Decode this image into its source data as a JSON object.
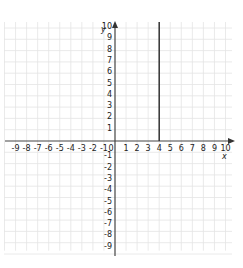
{
  "chart_data": {
    "type": "line",
    "title": "",
    "xlabel": "x",
    "ylabel": "y",
    "xlim": [
      -9,
      10
    ],
    "ylim": [
      -9,
      10
    ],
    "grid": true,
    "x_ticks": [
      -9,
      -8,
      -7,
      -6,
      -5,
      -4,
      -3,
      -2,
      -1,
      0,
      1,
      2,
      3,
      4,
      5,
      6,
      7,
      8,
      9,
      10
    ],
    "y_ticks": [
      10,
      9,
      8,
      7,
      6,
      5,
      4,
      3,
      2,
      1,
      -1,
      -2,
      -3,
      -4,
      -5,
      -6,
      -7,
      -8,
      -9
    ],
    "series": [
      {
        "name": "x = 4",
        "description": "vertical segment at x = 4 from y = 0 up to y = 10",
        "x": [
          4,
          4
        ],
        "y": [
          0,
          10
        ],
        "color": "#333333"
      }
    ]
  },
  "axes": {
    "x_label": "x",
    "y_label": "y",
    "origin_label": "0",
    "x_tick_labels": [
      "-9",
      "-8",
      "-7",
      "-6",
      "-5",
      "-4",
      "-3",
      "-2",
      "-1",
      "0",
      "1",
      "2",
      "3",
      "4",
      "5",
      "6",
      "7",
      "8",
      "9",
      "10"
    ],
    "y_tick_labels_pos": [
      "10",
      "9",
      "8",
      "7",
      "6",
      "5",
      "4",
      "3",
      "2",
      "1"
    ],
    "y_tick_labels_neg": [
      "-1",
      "-2",
      "-3",
      "-4",
      "-5",
      "-6",
      "-7",
      "-8",
      "-9"
    ]
  },
  "colors": {
    "grid": "#e4e4e4",
    "axis": "#444444",
    "line": "#333333"
  }
}
